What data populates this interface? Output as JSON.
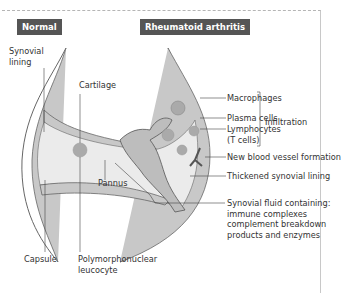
{
  "diagram": {
    "panels": {
      "normal": {
        "label": "Normal"
      },
      "ra": {
        "label": "Rheumatoid arthritis"
      }
    },
    "labels": {
      "synovial_lining": [
        "Synovial",
        "lining"
      ],
      "cartilage": "Cartilage",
      "macrophages": "Macrophages",
      "plasma_cells": "Plasma cells",
      "lymphocytes": [
        "Lymphocytes",
        "(T cells)"
      ],
      "infiltration": "Infiltration",
      "new_vessel": "New blood vessel formation",
      "thickened_lining": "Thickened synovial lining",
      "pannus": "Pannus",
      "synovial_fluid": [
        "Synovial fluid containing:",
        "immune complexes",
        "complement breakdown",
        "products and enzymes"
      ],
      "capsule": "Capsule",
      "pmn": [
        "Polymorphonuclear",
        "leucocyte"
      ]
    },
    "colors": {
      "badge_bg": "#555555",
      "tissue_fill": "#c8c8c8",
      "cavity_fill": "#ebebeb",
      "cell_fill": "#aaaaaa",
      "line": "#444444"
    }
  }
}
